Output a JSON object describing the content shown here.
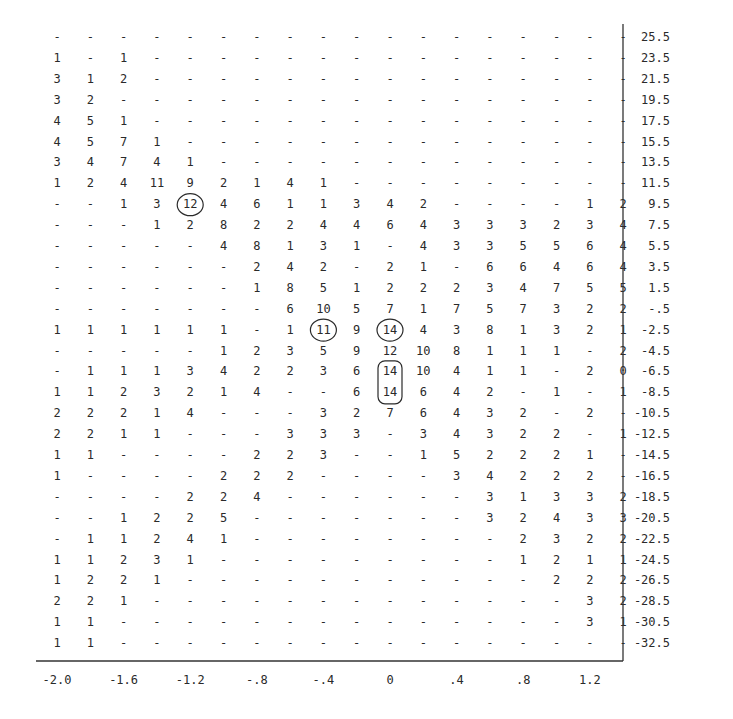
{
  "chart_data": {
    "type": "table",
    "title": "",
    "xlabel": "",
    "ylabel": "",
    "x": [
      -2.0,
      -1.8,
      -1.6,
      -1.4,
      -1.2,
      -1.0,
      -0.8,
      -0.6,
      -0.4,
      -0.2,
      0.0,
      0.2,
      0.4,
      0.6,
      0.8,
      1.0,
      1.2,
      1.4
    ],
    "x_tick_labels": [
      {
        "col": 0,
        "label": "-2.0"
      },
      {
        "col": 2,
        "label": "-1.6"
      },
      {
        "col": 4,
        "label": "-1.2"
      },
      {
        "col": 6,
        "label": "-.8"
      },
      {
        "col": 8,
        "label": "-.4"
      },
      {
        "col": 10,
        "label": "0"
      },
      {
        "col": 12,
        "label": ".4"
      },
      {
        "col": 14,
        "label": ".8"
      },
      {
        "col": 16,
        "label": "1.2"
      }
    ],
    "y_labels": [
      "25.5",
      "23.5",
      "21.5",
      "19.5",
      "17.5",
      "15.5",
      "13.5",
      "11.5",
      "9.5",
      "7.5",
      "5.5",
      "3.5",
      "1.5",
      "-.5",
      "-2.5",
      "-4.5",
      "-6.5",
      "-8.5",
      "-10.5",
      "-12.5",
      "-14.5",
      "-16.5",
      "-18.5",
      "-20.5",
      "-22.5",
      "-24.5",
      "-26.5",
      "-28.5",
      "-30.5",
      "-32.5"
    ],
    "y_axis_position": "right",
    "empty_symbol": "-",
    "grid": false,
    "rows": [
      [
        "-",
        "-",
        "-",
        "-",
        "-",
        "-",
        "-",
        "-",
        "-",
        "-",
        "-",
        "-",
        "-",
        "-",
        "-",
        "-",
        "-",
        "-"
      ],
      [
        "1",
        "-",
        "1",
        "-",
        "-",
        "-",
        "-",
        "-",
        "-",
        "-",
        "-",
        "-",
        "-",
        "-",
        "-",
        "-",
        "-",
        "-"
      ],
      [
        "3",
        "1",
        "2",
        "-",
        "-",
        "-",
        "-",
        "-",
        "-",
        "-",
        "-",
        "-",
        "-",
        "-",
        "-",
        "-",
        "-",
        "-"
      ],
      [
        "3",
        "2",
        "-",
        "-",
        "-",
        "-",
        "-",
        "-",
        "-",
        "-",
        "-",
        "-",
        "-",
        "-",
        "-",
        "-",
        "-",
        "-"
      ],
      [
        "4",
        "5",
        "1",
        "-",
        "-",
        "-",
        "-",
        "-",
        "-",
        "-",
        "-",
        "-",
        "-",
        "-",
        "-",
        "-",
        "-",
        "-"
      ],
      [
        "4",
        "5",
        "7",
        "1",
        "-",
        "-",
        "-",
        "-",
        "-",
        "-",
        "-",
        "-",
        "-",
        "-",
        "-",
        "-",
        "-",
        "-"
      ],
      [
        "3",
        "4",
        "7",
        "4",
        "1",
        "-",
        "-",
        "-",
        "-",
        "-",
        "-",
        "-",
        "-",
        "-",
        "-",
        "-",
        "-",
        "-"
      ],
      [
        "1",
        "2",
        "4",
        "11",
        "9",
        "2",
        "1",
        "4",
        "1",
        "-",
        "-",
        "-",
        "-",
        "-",
        "-",
        "-",
        "-",
        "-"
      ],
      [
        "-",
        "-",
        "1",
        "3",
        "12",
        "4",
        "6",
        "1",
        "1",
        "3",
        "4",
        "2",
        "-",
        "-",
        "-",
        "-",
        "1",
        "2"
      ],
      [
        "-",
        "-",
        "-",
        "1",
        "2",
        "8",
        "2",
        "2",
        "4",
        "4",
        "6",
        "4",
        "3",
        "3",
        "3",
        "2",
        "3",
        "4"
      ],
      [
        "-",
        "-",
        "-",
        "-",
        "-",
        "4",
        "8",
        "1",
        "3",
        "1",
        "-",
        "4",
        "3",
        "3",
        "5",
        "5",
        "6",
        "4"
      ],
      [
        "-",
        "-",
        "-",
        "-",
        "-",
        "-",
        "2",
        "4",
        "2",
        "-",
        "2",
        "1",
        "-",
        "6",
        "6",
        "4",
        "6",
        "4"
      ],
      [
        "-",
        "-",
        "-",
        "-",
        "-",
        "-",
        "1",
        "8",
        "5",
        "1",
        "2",
        "2",
        "2",
        "3",
        "4",
        "7",
        "5",
        "5"
      ],
      [
        "-",
        "-",
        "-",
        "-",
        "-",
        "-",
        "-",
        "6",
        "10",
        "5",
        "7",
        "1",
        "7",
        "5",
        "7",
        "3",
        "2",
        "2"
      ],
      [
        "1",
        "1",
        "1",
        "1",
        "1",
        "1",
        "-",
        "1",
        "11",
        "9",
        "14",
        "4",
        "3",
        "8",
        "1",
        "3",
        "2",
        "1"
      ],
      [
        "-",
        "-",
        "-",
        "-",
        "-",
        "1",
        "2",
        "3",
        "5",
        "9",
        "12",
        "10",
        "8",
        "1",
        "1",
        "1",
        "-",
        "2"
      ],
      [
        "-",
        "1",
        "1",
        "1",
        "3",
        "4",
        "2",
        "2",
        "3",
        "6",
        "14",
        "10",
        "4",
        "1",
        "1",
        "-",
        "2",
        "0"
      ],
      [
        "1",
        "1",
        "2",
        "3",
        "2",
        "1",
        "4",
        "-",
        "-",
        "6",
        "14",
        "6",
        "4",
        "2",
        "-",
        "1",
        "-",
        "1"
      ],
      [
        "2",
        "2",
        "2",
        "1",
        "4",
        "-",
        "-",
        "-",
        "3",
        "2",
        "7",
        "6",
        "4",
        "3",
        "2",
        "-",
        "2",
        "-"
      ],
      [
        "2",
        "2",
        "1",
        "1",
        "-",
        "-",
        "-",
        "3",
        "3",
        "3",
        "-",
        "3",
        "4",
        "3",
        "2",
        "2",
        "-",
        "1"
      ],
      [
        "1",
        "1",
        "-",
        "-",
        "-",
        "-",
        "2",
        "2",
        "3",
        "-",
        "-",
        "1",
        "5",
        "2",
        "2",
        "2",
        "1",
        "-"
      ],
      [
        "1",
        "-",
        "-",
        "-",
        "-",
        "2",
        "2",
        "2",
        "-",
        "-",
        "-",
        "-",
        "3",
        "4",
        "2",
        "2",
        "2",
        "-"
      ],
      [
        "-",
        "-",
        "-",
        "-",
        "2",
        "2",
        "4",
        "-",
        "-",
        "-",
        "-",
        "-",
        "-",
        "3",
        "1",
        "3",
        "3",
        "2"
      ],
      [
        "-",
        "-",
        "1",
        "2",
        "2",
        "5",
        "-",
        "-",
        "-",
        "-",
        "-",
        "-",
        "-",
        "3",
        "2",
        "4",
        "3",
        "3"
      ],
      [
        "-",
        "1",
        "1",
        "2",
        "4",
        "1",
        "-",
        "-",
        "-",
        "-",
        "-",
        "-",
        "-",
        "-",
        "2",
        "3",
        "2",
        "2"
      ],
      [
        "1",
        "1",
        "2",
        "3",
        "1",
        "-",
        "-",
        "-",
        "-",
        "-",
        "-",
        "-",
        "-",
        "-",
        "1",
        "2",
        "1",
        "1"
      ],
      [
        "1",
        "2",
        "2",
        "1",
        "-",
        "-",
        "-",
        "-",
        "-",
        "-",
        "-",
        "-",
        "-",
        "-",
        "-",
        "2",
        "2",
        "2"
      ],
      [
        "2",
        "2",
        "1",
        "-",
        "-",
        "-",
        "-",
        "-",
        "-",
        "-",
        "-",
        "-",
        "-",
        "-",
        "-",
        "-",
        "3",
        "2"
      ],
      [
        "1",
        "1",
        "-",
        "-",
        "-",
        "-",
        "-",
        "-",
        "-",
        "-",
        "-",
        "-",
        "-",
        "-",
        "-",
        "-",
        "3",
        "1"
      ],
      [
        "1",
        "1",
        "-",
        "-",
        "-",
        "-",
        "-",
        "-",
        "-",
        "-",
        "-",
        "-",
        "-",
        "-",
        "-",
        "-",
        "-",
        "-"
      ]
    ],
    "annotations": [
      {
        "type": "circle",
        "row": 8,
        "col": 4,
        "value": "12"
      },
      {
        "type": "circle",
        "row": 14,
        "col": 8,
        "value": "11"
      },
      {
        "type": "circle",
        "row": 14,
        "col": 10,
        "value": "14"
      },
      {
        "type": "rounded-box",
        "row_start": 16,
        "row_end": 17,
        "col": 10,
        "values": [
          "14",
          "14"
        ]
      }
    ]
  }
}
